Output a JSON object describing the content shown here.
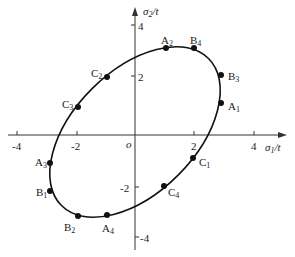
{
  "diagram": {
    "type": "ellipse-in-stress-plane",
    "axes": {
      "x_label": "σ1/t",
      "x_label_main": "σ",
      "x_label_sub": "1",
      "x_label_tail": "/t",
      "y_label_main": "σ",
      "y_label_sub": "2",
      "y_label_tail": "/t",
      "origin_label": "o",
      "x_ticks": [
        "-4",
        "-2",
        "2",
        "4"
      ],
      "y_ticks": [
        "4",
        "2",
        "-2",
        "-4"
      ]
    },
    "points": [
      {
        "id": "A1",
        "main": "A",
        "sub": "1"
      },
      {
        "id": "A2",
        "main": "A",
        "sub": "2"
      },
      {
        "id": "A3",
        "main": "A",
        "sub": "3"
      },
      {
        "id": "A4",
        "main": "A",
        "sub": "4"
      },
      {
        "id": "B1",
        "main": "B",
        "sub": "1"
      },
      {
        "id": "B2",
        "main": "B",
        "sub": "2"
      },
      {
        "id": "B3",
        "main": "B",
        "sub": "3"
      },
      {
        "id": "B4",
        "main": "B",
        "sub": "4"
      },
      {
        "id": "C1",
        "main": "C",
        "sub": "1"
      },
      {
        "id": "C2",
        "main": "C",
        "sub": "2"
      },
      {
        "id": "C3",
        "main": "C",
        "sub": "3"
      },
      {
        "id": "C4",
        "main": "C",
        "sub": "4"
      }
    ],
    "colors": {
      "line": "#111111",
      "point": "#111111",
      "background": "#ffffff"
    }
  }
}
